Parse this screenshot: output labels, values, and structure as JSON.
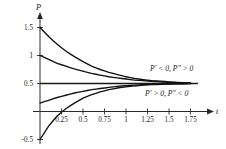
{
  "chart_data": {
    "type": "line",
    "title": "",
    "xlabel": "t",
    "ylabel": "P",
    "xlim": [
      -0.05,
      1.95
    ],
    "ylim": [
      -0.62,
      1.72
    ],
    "grid": false,
    "legend": "none",
    "xticks": [
      "0.25",
      "0.5",
      "0.75",
      "1",
      "1.25",
      "1.5",
      "1.75"
    ],
    "xtick_values": [
      0.25,
      0.5,
      0.75,
      1,
      1.25,
      1.5,
      1.75
    ],
    "yticks": [
      "1.5",
      "1",
      "0.5",
      "-0.5"
    ],
    "ytick_values": [
      1.5,
      1,
      0.5,
      -0.5
    ],
    "equilibrium": {
      "name": "equilibrium-solution",
      "value": 0.5,
      "label": ""
    },
    "series": [
      {
        "name": "solution-from-1.5",
        "start": [
          0,
          1.5
        ],
        "x": [
          0,
          0.1,
          0.2,
          0.3,
          0.4,
          0.5,
          0.6,
          0.7,
          0.8,
          0.9,
          1.0,
          1.1,
          1.2,
          1.3,
          1.4,
          1.5,
          1.6,
          1.75
        ],
        "values": [
          1.5,
          1.34,
          1.2,
          1.08,
          0.98,
          0.89,
          0.81,
          0.75,
          0.7,
          0.66,
          0.62,
          0.59,
          0.57,
          0.55,
          0.54,
          0.53,
          0.52,
          0.51
        ]
      },
      {
        "name": "solution-from-1.0",
        "start": [
          0,
          1.0
        ],
        "x": [
          0,
          0.1,
          0.2,
          0.3,
          0.4,
          0.5,
          0.6,
          0.7,
          0.8,
          0.9,
          1.0,
          1.1,
          1.2,
          1.3,
          1.4,
          1.5,
          1.6,
          1.75
        ],
        "values": [
          1.0,
          0.93,
          0.86,
          0.81,
          0.76,
          0.72,
          0.68,
          0.65,
          0.62,
          0.6,
          0.58,
          0.56,
          0.55,
          0.54,
          0.53,
          0.52,
          0.515,
          0.51
        ]
      },
      {
        "name": "solution-from-0.15",
        "start": [
          0,
          0.15
        ],
        "x": [
          0,
          0.1,
          0.2,
          0.3,
          0.4,
          0.5,
          0.6,
          0.7,
          0.8,
          0.9,
          1.0,
          1.1,
          1.2,
          1.3,
          1.4,
          1.5,
          1.6,
          1.75
        ],
        "values": [
          0.15,
          0.2,
          0.25,
          0.29,
          0.33,
          0.36,
          0.39,
          0.41,
          0.43,
          0.45,
          0.46,
          0.47,
          0.48,
          0.485,
          0.49,
          0.493,
          0.496,
          0.498
        ]
      },
      {
        "name": "solution-from--0.5",
        "start": [
          0,
          -0.5
        ],
        "x": [
          0,
          0.1,
          0.2,
          0.3,
          0.4,
          0.5,
          0.6,
          0.7,
          0.8,
          0.9,
          1.0,
          1.1,
          1.2,
          1.3,
          1.4,
          1.5,
          1.6,
          1.75
        ],
        "values": [
          -0.5,
          -0.26,
          -0.08,
          0.05,
          0.15,
          0.24,
          0.3,
          0.35,
          0.39,
          0.42,
          0.44,
          0.455,
          0.47,
          0.48,
          0.485,
          0.49,
          0.494,
          0.497
        ]
      }
    ],
    "annotations": [
      {
        "name": "annotation-above-equilibrium",
        "text": "P′ < 0, P″ > 0",
        "parts": [
          "P′",
          " < ",
          "0, ",
          "P″",
          " > ",
          "0"
        ],
        "x": 1.45,
        "y": 0.78
      },
      {
        "name": "annotation-below-equilibrium",
        "text": "P′ > 0, P″ < 0",
        "parts": [
          "P′",
          " > ",
          "0, ",
          "P″",
          " < ",
          "0"
        ],
        "x": 1.4,
        "y": 0.27
      }
    ],
    "colors": {
      "curve": "#111111",
      "axis": "#2a2a2a",
      "text": "#1a1a1a",
      "background": "#ffffff"
    }
  }
}
